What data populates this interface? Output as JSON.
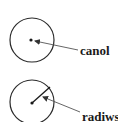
{
  "diagram": {
    "colors": {
      "stroke": "#2a2a2a",
      "arrow": "#555555",
      "text": "#1a1a1a",
      "background": "#ffffff"
    },
    "figures": [
      {
        "id": "centre",
        "label": "canol",
        "circle": {
          "cx": 32,
          "cy": 40,
          "r": 22
        },
        "centre_point": {
          "x": 31,
          "y": 40
        },
        "radius_line": null,
        "pointer": {
          "from": {
            "x": 78,
            "y": 50
          },
          "to": {
            "x": 35,
            "y": 41
          }
        },
        "label_pos": {
          "x": 80,
          "y": 55
        }
      },
      {
        "id": "radius",
        "label": "radiws",
        "circle": {
          "cx": 32,
          "cy": 102,
          "r": 22
        },
        "centre_point": {
          "x": 32,
          "y": 103
        },
        "radius_line": {
          "from": {
            "x": 32,
            "y": 103
          },
          "to": {
            "x": 50,
            "y": 87
          }
        },
        "pointer": {
          "from": {
            "x": 80,
            "y": 112
          },
          "to": {
            "x": 43,
            "y": 97
          }
        },
        "label_pos": {
          "x": 82,
          "y": 121
        }
      }
    ]
  }
}
